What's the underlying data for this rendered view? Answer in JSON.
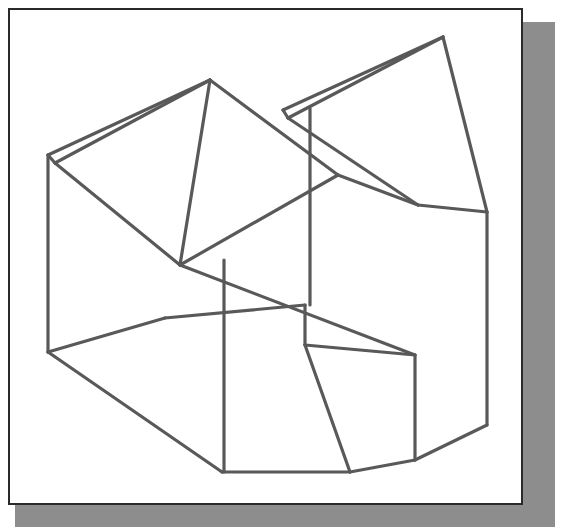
{
  "document": {
    "type": "isometric-line-drawing",
    "title": "Isometric pictorial of a notched machined block",
    "background_color": "#ffffff",
    "frame": {
      "border_color": "#2a2a2a",
      "border_width_px": 2,
      "fill_color": "#ffffff",
      "x": 8,
      "y": 8,
      "width": 515,
      "height": 497
    },
    "shadow": {
      "color": "#8d8d8d",
      "x": 15,
      "y": 22,
      "width": 540,
      "height": 505
    },
    "line_style": {
      "stroke_color": "#595959",
      "stroke_width_px": 3.2,
      "fill": "none",
      "linecap": "round",
      "linejoin": "round"
    }
  },
  "drawing": {
    "view": "isometric",
    "visible_text": [],
    "labels": [],
    "dimensions": [],
    "edges": [
      {
        "name": "left-vertical-edge",
        "points": "48,155 48,352"
      },
      {
        "name": "left-front-lower-bevel",
        "points": "48,352 222,472"
      },
      {
        "name": "bottom-front-edge",
        "points": "222,472 350,472"
      },
      {
        "name": "bottom-right-step-edge",
        "points": "350,472 415,460"
      },
      {
        "name": "bottom-right-bevel-edge",
        "points": "415,460 487,425"
      },
      {
        "name": "right-vertical-edge",
        "points": "487,425 487,212"
      },
      {
        "name": "right-upper-bevel-edge",
        "points": "487,212 443,37"
      },
      {
        "name": "top-ridge-right-front",
        "points": "443,37 283,110"
      },
      {
        "name": "top-ridge-right-back",
        "points": "443,37 288,118"
      },
      {
        "name": "top-ridge-right-cap",
        "points": "283,110 288,118"
      },
      {
        "name": "top-ridge-left-front",
        "points": "210,80 48,155"
      },
      {
        "name": "top-ridge-left-back",
        "points": "210,80 55,163"
      },
      {
        "name": "top-ridge-left-cap",
        "points": "48,155 55,163"
      },
      {
        "name": "left-peak-to-valley",
        "points": "210,80 180,265"
      },
      {
        "name": "left-back-slope",
        "points": "55,163 180,265"
      },
      {
        "name": "valley-rise-to-mid",
        "points": "180,265 338,175"
      },
      {
        "name": "peak-to-crossing-slope",
        "points": "210,80 338,175"
      },
      {
        "name": "mid-vertical-edge",
        "points": "310,108 310,305"
      },
      {
        "name": "right-inner-slope-edge",
        "points": "338,175 418,205"
      },
      {
        "name": "right-inner-upper-edge",
        "points": "288,118 418,205"
      },
      {
        "name": "right-inner-long-slope",
        "points": "418,205 487,212"
      },
      {
        "name": "channel-upper-slope",
        "points": "180,265 415,355"
      },
      {
        "name": "channel-floor-front",
        "points": "165,318 305,305"
      },
      {
        "name": "left-face-vertical",
        "points": "48,352 165,318"
      },
      {
        "name": "front-vertical-edge",
        "points": "224,260 224,472"
      },
      {
        "name": "channel-step-vertical",
        "points": "305,305 305,345"
      },
      {
        "name": "channel-floor-slope",
        "points": "305,345 415,355"
      },
      {
        "name": "channel-right-vertical",
        "points": "415,355 415,460"
      },
      {
        "name": "channel-face-edge",
        "points": "305,345 350,472"
      }
    ]
  }
}
